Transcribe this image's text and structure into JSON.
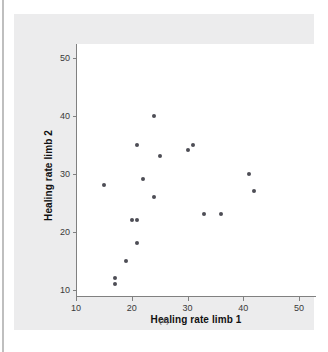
{
  "figure": {
    "caption": "(a)",
    "panel_background": "#ececed",
    "plot_background": "#ffffff",
    "axis_color": "#808080",
    "point_color": "#4d4d55"
  },
  "chart_data": {
    "type": "scatter",
    "title": "",
    "xlabel": "Healing rate limb 1",
    "ylabel": "Healing rate limb 2",
    "xlim": [
      7,
      52
    ],
    "ylim": [
      8,
      52
    ],
    "xticks": [
      10,
      20,
      30,
      40,
      50
    ],
    "yticks": [
      10,
      20,
      30,
      40,
      50
    ],
    "xticklabels": [
      "10",
      "20",
      "30",
      "40",
      "50"
    ],
    "yticklabels": [
      "10",
      "20",
      "30",
      "40",
      "50"
    ],
    "grid": false,
    "legend": null,
    "marker": "filled-circle",
    "n_points": 18,
    "points": [
      {
        "x": 15,
        "y": 28
      },
      {
        "x": 17,
        "y": 12
      },
      {
        "x": 17,
        "y": 11
      },
      {
        "x": 19,
        "y": 15
      },
      {
        "x": 20,
        "y": 22
      },
      {
        "x": 21,
        "y": 22
      },
      {
        "x": 21,
        "y": 18
      },
      {
        "x": 21,
        "y": 35
      },
      {
        "x": 22,
        "y": 29
      },
      {
        "x": 24,
        "y": 40
      },
      {
        "x": 24,
        "y": 26
      },
      {
        "x": 25,
        "y": 33
      },
      {
        "x": 30,
        "y": 34
      },
      {
        "x": 31,
        "y": 35
      },
      {
        "x": 33,
        "y": 23
      },
      {
        "x": 36,
        "y": 23
      },
      {
        "x": 41,
        "y": 30
      },
      {
        "x": 42,
        "y": 27
      }
    ]
  }
}
